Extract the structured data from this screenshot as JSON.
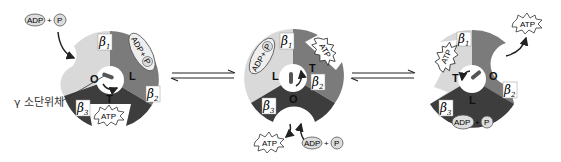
{
  "diagram": {
    "colors": {
      "light": "#d9d9d9",
      "medium": "#7b7b7b",
      "dark": "#3d3d3d",
      "background": "#ffffff",
      "ink": "#222222"
    },
    "gamma_subunit_label": "γ 소단위체",
    "equilibrium_arrows": [
      "⇌",
      "⇌"
    ],
    "states": [
      {
        "id": "state-1",
        "subunits": [
          {
            "name": "β1",
            "base": "β",
            "sub": "1",
            "site": "O",
            "shade": "light"
          },
          {
            "name": "β2",
            "base": "β",
            "sub": "2",
            "site": "L",
            "shade": "medium"
          },
          {
            "name": "β3",
            "base": "β",
            "sub": "3",
            "site": "T",
            "shade": "dark"
          }
        ],
        "inputs": {
          "adp": "ADP",
          "plus": "+",
          "pi": "P",
          "pi_sub": "i"
        },
        "bound_on_L": {
          "adp": "ADP",
          "plus": "+",
          "pi": "P",
          "pi_sub": "i"
        },
        "bound_on_T": "ATP"
      },
      {
        "id": "state-2",
        "subunits": [
          {
            "name": "β1",
            "base": "β",
            "sub": "1",
            "site": "L",
            "shade": "light"
          },
          {
            "name": "β2",
            "base": "β",
            "sub": "2",
            "site": "T",
            "shade": "medium"
          },
          {
            "name": "β3",
            "base": "β",
            "sub": "3",
            "site": "O",
            "shade": "dark"
          }
        ],
        "bound_on_L": {
          "adp": "ADP",
          "plus": "+",
          "pi": "P",
          "pi_sub": "i"
        },
        "bound_on_T": "ATP",
        "released": "ATP",
        "entering": {
          "adp": "ADP",
          "plus": "+",
          "pi": "P",
          "pi_sub": "i"
        }
      },
      {
        "id": "state-3",
        "subunits": [
          {
            "name": "β1",
            "base": "β",
            "sub": "1",
            "site": "T",
            "shade": "light"
          },
          {
            "name": "β2",
            "base": "β",
            "sub": "2",
            "site": "O",
            "shade": "medium"
          },
          {
            "name": "β3",
            "base": "β",
            "sub": "3",
            "site": "L",
            "shade": "dark"
          }
        ],
        "bound_on_T": "ATP",
        "bound_on_L": {
          "adp": "ADP",
          "plus": "+",
          "pi": "P",
          "pi_sub": "i"
        },
        "released": "ATP"
      }
    ]
  }
}
